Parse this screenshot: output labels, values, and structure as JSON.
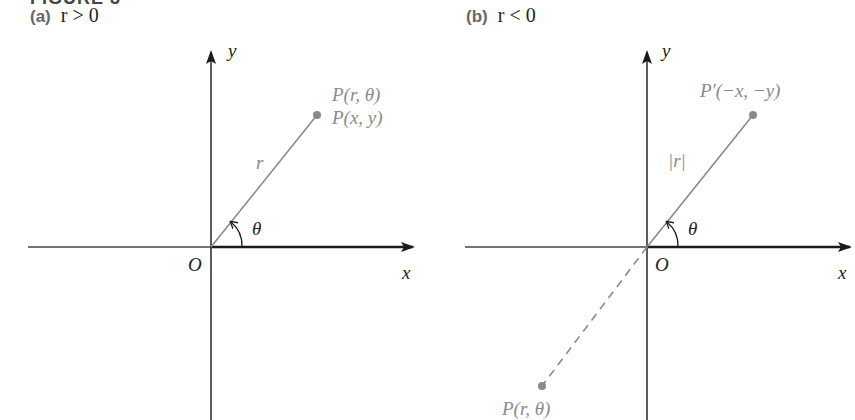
{
  "heading": "FIGURE 3",
  "panels": [
    {
      "tag": "(a)",
      "condition": "r > 0",
      "axis_labels": {
        "x": "x",
        "y": "y",
        "origin": "O"
      },
      "angle_label": "θ",
      "segment_label": "r",
      "point_labels": [
        "P(r, θ)",
        "P(x, y)"
      ]
    },
    {
      "tag": "(b)",
      "condition": "r < 0",
      "axis_labels": {
        "x": "x",
        "y": "y",
        "origin": "O"
      },
      "angle_label": "θ",
      "segment_label": "|r|",
      "point_labels": [
        "P′(−x, −y)",
        "P(r, θ)"
      ]
    }
  ],
  "colors": {
    "axis": "#1a1a1a",
    "ray": "#8a8a8a",
    "point": "#8a8a8a",
    "label_gray": "#8a8a8a"
  }
}
